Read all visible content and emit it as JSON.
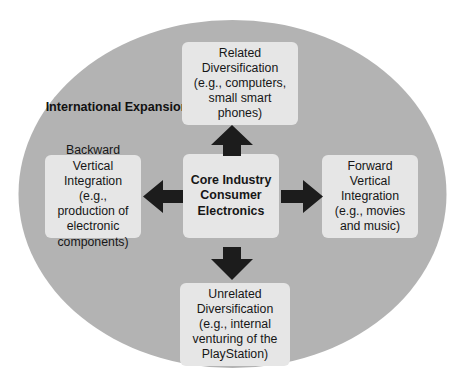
{
  "diagram": {
    "type": "corporate-diversification-strategy",
    "background_ellipse": {
      "label": "International Expansion",
      "fill_color": "#b3b3b3"
    },
    "box_fill_color": "#e6e6e6",
    "arrow_color": "#1c1c1c",
    "center": {
      "name": "core-industry",
      "text": "Core Industry Consumer Electronics"
    },
    "nodes": {
      "top": {
        "name": "related-diversification",
        "text": "Related Diversification (e.g., computers, small smart phones)"
      },
      "left": {
        "name": "backward-vertical-integration",
        "text": "Backward Vertical Integration (e.g., production of electronic components)"
      },
      "right": {
        "name": "forward-vertical-integration",
        "text": "Forward Vertical Integration (e.g., movies and music)"
      },
      "bottom": {
        "name": "unrelated-diversification",
        "text": "Unrelated Diversification (e.g., internal venturing of the PlayStation)"
      }
    },
    "arrows": [
      {
        "name": "arrow-up-to-related-diversification",
        "direction": "up"
      },
      {
        "name": "arrow-down-to-unrelated-diversification",
        "direction": "down"
      },
      {
        "name": "arrow-left-to-backward-vertical-integration",
        "direction": "left"
      },
      {
        "name": "arrow-right-to-forward-vertical-integration",
        "direction": "right"
      }
    ]
  }
}
